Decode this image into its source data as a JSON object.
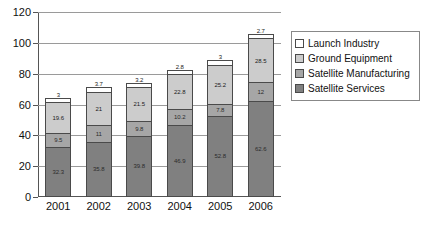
{
  "chart_data": {
    "type": "bar",
    "stacked": true,
    "title": "",
    "xlabel": "",
    "ylabel": "",
    "ylim": [
      0,
      120
    ],
    "ytick_values": [
      0,
      20,
      40,
      60,
      80,
      100,
      120
    ],
    "ytick_labels": [
      "0",
      "20",
      "40",
      "60",
      "80",
      "100",
      "120"
    ],
    "grid": true,
    "legend_position": "right",
    "categories": [
      "2001",
      "2002",
      "2003",
      "2004",
      "2005",
      "2006"
    ],
    "series": [
      {
        "name": "Satellite Services",
        "color": "#808080",
        "values": [
          32.3,
          35.8,
          39.8,
          46.9,
          52.8,
          62.6
        ],
        "labels": [
          "32.3",
          "35.8",
          "39.8",
          "46.9",
          "52.8",
          "62.6"
        ]
      },
      {
        "name": "Satellite Manufacturing",
        "color": "#a6a6a6",
        "values": [
          9.5,
          11,
          9.8,
          10.2,
          7.8,
          12
        ],
        "labels": [
          "9.5",
          "11",
          "9.8",
          "10.2",
          "7.8",
          "12"
        ]
      },
      {
        "name": "Ground Equipment",
        "color": "#cccccc",
        "values": [
          19.6,
          21,
          21.5,
          22.8,
          25.2,
          28.5
        ],
        "labels": [
          "19.6",
          "21",
          "21.5",
          "22.8",
          "25.2",
          "28.5"
        ]
      },
      {
        "name": "Launch Industry",
        "color": "#ffffff",
        "values": [
          3,
          3.7,
          3.2,
          2.8,
          3,
          2.7
        ],
        "labels": [
          "3",
          "3.7",
          "3.2",
          "2.8",
          "3",
          "2.7"
        ]
      }
    ],
    "totals": [
      64.4,
      71.5,
      74.3,
      82.7,
      88.8,
      105.8
    ]
  },
  "legend": {
    "items": [
      {
        "label": "Launch Industry",
        "color": "#ffffff"
      },
      {
        "label": "Ground Equipment",
        "color": "#cccccc"
      },
      {
        "label": "Satellite Manufacturing",
        "color": "#a6a6a6"
      },
      {
        "label": "Satellite Services",
        "color": "#808080"
      }
    ]
  }
}
